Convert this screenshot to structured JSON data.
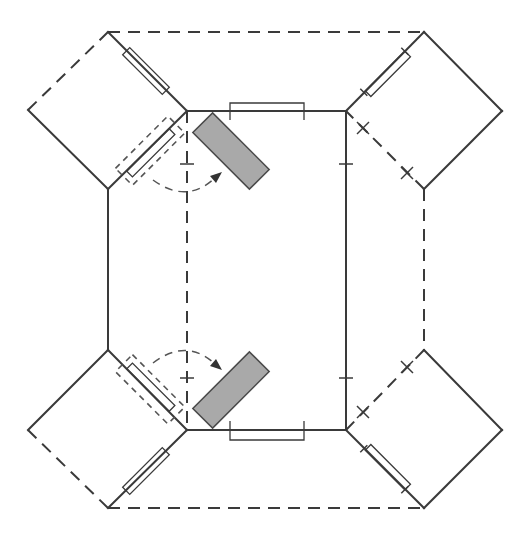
{
  "diagram": {
    "type": "fold-out-net",
    "colors": {
      "line": "#3a3a3a",
      "panel_fill": "#a9a9a9",
      "background": "#ffffff"
    },
    "components": {
      "center_panel": "rectangular base",
      "corner_flaps": [
        "top-left",
        "top-right",
        "bottom-left",
        "bottom-right"
      ],
      "rotating_panels": [
        "upper",
        "lower"
      ],
      "hinges": [
        "top-edge",
        "bottom-edge",
        "top-left-flap-outer",
        "bottom-left-flap-outer",
        "top-right-flap",
        "bottom-right-flap",
        "top-left-flap-inner",
        "bottom-left-flap-inner"
      ],
      "rotation_arrows": [
        "upper-arrow",
        "lower-arrow"
      ]
    },
    "line_styles": {
      "fold_line": "dashed",
      "cut_line": "solid"
    }
  }
}
